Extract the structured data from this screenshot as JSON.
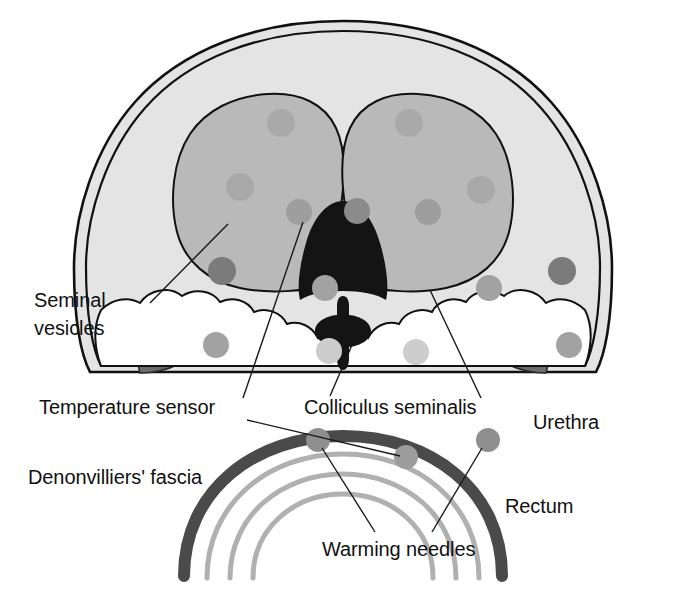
{
  "figure": {
    "background": "#ffffff"
  },
  "labels": {
    "seminal_vesicles_line1": "Seminal",
    "seminal_vesicles_line2": "vesicles",
    "temperature_sensor": "Temperature sensor",
    "denonvilliers_fascia": "Denonvilliers' fascia",
    "colliculus_seminalis": "Colliculus seminalis",
    "urethra": "Urethra",
    "rectum": "Rectum",
    "warming_needles": "Warming needles"
  },
  "colors": {
    "page_background": "#ffffff",
    "capsule_fill": "#e4e4e4",
    "lobe_fill": "#b9b9b9",
    "urethra_black": "#141414",
    "colliculus_black": "#141414",
    "seminal_vesicle_gray": "#6d6d6d",
    "periurethral_white": "#ffffff",
    "needle_dark": "#7b7b7b",
    "needle_mid": "#9e9e9e",
    "needle_light": "#cdcdcd",
    "fascia_dark": "#4a4a4a",
    "rectum_wall_gray": "#b0b0b0",
    "outline_stroke": "#111111",
    "leader_stroke": "#1a1a1a"
  },
  "structures": [
    {
      "name": "prostate-capsule",
      "shade": "light-gray",
      "description": "Outer prostate capsule, dome shaped"
    },
    {
      "name": "prostate-lobe-left",
      "shade": "medium-gray",
      "description": "Left transition zone lobe"
    },
    {
      "name": "prostate-lobe-right",
      "shade": "medium-gray",
      "description": "Right transition zone lobe"
    },
    {
      "name": "urethra",
      "shade": "black",
      "description": "Central teardrop urethral lumen"
    },
    {
      "name": "colliculus-seminalis",
      "shade": "black",
      "description": "Verumontanum below urethra"
    },
    {
      "name": "seminal-vesicle-left",
      "shade": "dark-gray",
      "description": "Left posterolateral crescent"
    },
    {
      "name": "seminal-vesicle-right",
      "shade": "dark-gray",
      "description": "Right posterolateral crescent"
    },
    {
      "name": "peripheral-zone",
      "shade": "white",
      "description": "Lobulated posterior peripheral zone"
    },
    {
      "name": "denonvilliers-fascia",
      "shade": "dark-gray-arc",
      "description": "Thick arc between prostate and rectum"
    },
    {
      "name": "rectum-wall",
      "shade": "light-gray-arcs",
      "description": "Three concentric rectal wall arcs"
    }
  ],
  "needles": {
    "counts": {
      "dark": 10,
      "mid": 9,
      "light": 4,
      "on_fascia": 3
    },
    "note": "Circular warming needle cross-sections distributed through prostate and on Denonvilliers' fascia"
  }
}
